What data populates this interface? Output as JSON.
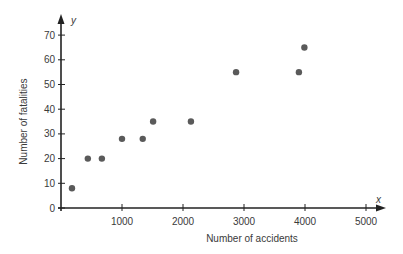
{
  "chart_data": {
    "type": "scatter",
    "title": "",
    "xlabel": "Number of accidents",
    "ylabel": "Number of fatalities",
    "x_axis_var": "x",
    "y_axis_var": "y",
    "xlim": [
      0,
      5400
    ],
    "ylim": [
      0,
      77
    ],
    "x_ticks": [
      1000,
      2000,
      3000,
      4000,
      5000
    ],
    "x_tick_labels": [
      "1000",
      "2000",
      "3000",
      "4000",
      "5000"
    ],
    "y_ticks": [
      0,
      10,
      20,
      30,
      40,
      50,
      60,
      70
    ],
    "y_tick_labels": [
      "0",
      "10",
      "20",
      "30",
      "40",
      "50",
      "60",
      "70"
    ],
    "grid": false,
    "legend": null,
    "points": [
      {
        "x": 180,
        "y": 8
      },
      {
        "x": 440,
        "y": 20
      },
      {
        "x": 670,
        "y": 20
      },
      {
        "x": 1000,
        "y": 28
      },
      {
        "x": 1340,
        "y": 28
      },
      {
        "x": 1510,
        "y": 35
      },
      {
        "x": 2130,
        "y": 35
      },
      {
        "x": 2870,
        "y": 55
      },
      {
        "x": 3900,
        "y": 55
      },
      {
        "x": 3990,
        "y": 65
      }
    ],
    "marker_color": "#5a5a5a",
    "axis_color": "#222222"
  }
}
